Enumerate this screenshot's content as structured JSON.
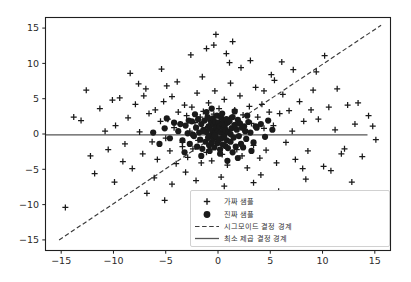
{
  "chart_data": {
    "type": "scatter",
    "title": "",
    "xlabel": "",
    "ylabel": "",
    "xlim": [
      -16.5,
      16.5
    ],
    "ylim": [
      -16.5,
      16.5
    ],
    "grid": false,
    "xticks": [
      -15,
      -10,
      -5,
      0,
      5,
      10,
      15
    ],
    "xticklabels": [
      "−15",
      "−10",
      "−5",
      "0",
      "5",
      "10",
      "15"
    ],
    "yticks": [
      -15,
      -10,
      -5,
      0,
      5,
      10,
      15
    ],
    "yticklabels": [
      "−15",
      "−10",
      "−5",
      "0",
      "5",
      "10",
      "15"
    ],
    "legend_position": "lower right",
    "series": [
      {
        "name": "가짜 샘플",
        "marker": "plus",
        "color": "#1a1a1a",
        "points": [
          [
            -14.6,
            -10.4
          ],
          [
            -12.2,
            -3.1
          ],
          [
            -11.3,
            3.6
          ],
          [
            -10.5,
            -2.2
          ],
          [
            -9.8,
            1.2
          ],
          [
            -9.4,
            5.1
          ],
          [
            -8.9,
            -1.4
          ],
          [
            -8.6,
            2.3
          ],
          [
            -8.2,
            -4.9
          ],
          [
            -7.9,
            4.2
          ],
          [
            -7.5,
            0.3
          ],
          [
            -7.2,
            -2.8
          ],
          [
            -6.9,
            6.4
          ],
          [
            -6.6,
            2.9
          ],
          [
            -6.3,
            -1.1
          ],
          [
            -6.0,
            3.4
          ],
          [
            -5.8,
            -3.6
          ],
          [
            -5.5,
            1.8
          ],
          [
            -5.2,
            4.6
          ],
          [
            -5.0,
            -0.6
          ],
          [
            -4.8,
            2.1
          ],
          [
            -4.6,
            -2.4
          ],
          [
            -4.4,
            5.3
          ],
          [
            -4.2,
            0.9
          ],
          [
            -4.0,
            -4.2
          ],
          [
            -3.8,
            3.1
          ],
          [
            -3.6,
            1.4
          ],
          [
            -3.4,
            -1.8
          ],
          [
            -3.2,
            4.1
          ],
          [
            -3.0,
            2.6
          ],
          [
            -2.9,
            -3.3
          ],
          [
            -2.7,
            0.4
          ],
          [
            -2.5,
            3.8
          ],
          [
            -2.4,
            -2.1
          ],
          [
            -2.2,
            1.6
          ],
          [
            -2.0,
            5.8
          ],
          [
            -1.9,
            -0.9
          ],
          [
            -1.7,
            2.4
          ],
          [
            -1.6,
            -4.1
          ],
          [
            -1.4,
            3.2
          ],
          [
            -1.2,
            0.7
          ],
          [
            -1.1,
            -2.6
          ],
          [
            -0.9,
            4.4
          ],
          [
            -0.8,
            1.1
          ],
          [
            -0.6,
            -3.8
          ],
          [
            -0.4,
            2.8
          ],
          [
            -0.3,
            6.1
          ],
          [
            -0.1,
            -1.3
          ],
          [
            0.1,
            3.6
          ],
          [
            0.2,
            0.2
          ],
          [
            0.4,
            -2.9
          ],
          [
            0.6,
            4.9
          ],
          [
            0.7,
            1.9
          ],
          [
            0.9,
            -4.4
          ],
          [
            1.1,
            2.2
          ],
          [
            1.2,
            7.2
          ],
          [
            1.4,
            -0.4
          ],
          [
            1.6,
            3.4
          ],
          [
            1.8,
            -2.2
          ],
          [
            1.9,
            1.3
          ],
          [
            2.1,
            5.4
          ],
          [
            2.3,
            -3.1
          ],
          [
            2.4,
            2.7
          ],
          [
            2.6,
            0.6
          ],
          [
            2.8,
            -4.8
          ],
          [
            3.0,
            3.9
          ],
          [
            3.2,
            1.5
          ],
          [
            3.4,
            -1.6
          ],
          [
            3.6,
            6.6
          ],
          [
            3.8,
            2.4
          ],
          [
            4.0,
            -3.4
          ],
          [
            4.2,
            4.2
          ],
          [
            4.4,
            0.8
          ],
          [
            4.6,
            -2.3
          ],
          [
            4.9,
            3.1
          ],
          [
            5.1,
            8.4
          ],
          [
            5.3,
            1.2
          ],
          [
            5.6,
            -4.1
          ],
          [
            5.9,
            2.9
          ],
          [
            6.2,
            5.6
          ],
          [
            6.5,
            -1.2
          ],
          [
            6.8,
            3.3
          ],
          [
            7.1,
            0.4
          ],
          [
            7.4,
            -3.6
          ],
          [
            7.8,
            4.6
          ],
          [
            8.2,
            1.8
          ],
          [
            8.6,
            -2.4
          ],
          [
            9.1,
            6.2
          ],
          [
            9.6,
            2.1
          ],
          [
            10.1,
            -4.6
          ],
          [
            10.6,
            3.8
          ],
          [
            11.2,
            0.6
          ],
          [
            11.8,
            -2.8
          ],
          [
            12.4,
            4.1
          ],
          [
            13.1,
            1.4
          ],
          [
            13.8,
            -3.2
          ],
          [
            14.4,
            2.6
          ],
          [
            15.1,
            -0.8
          ],
          [
            -13.1,
            1.9
          ],
          [
            -11.8,
            -5.6
          ],
          [
            -10.1,
            4.8
          ],
          [
            -9.1,
            -3.9
          ],
          [
            -7.6,
            7.1
          ],
          [
            -6.1,
            -6.2
          ],
          [
            -4.9,
            6.8
          ],
          [
            -3.1,
            -5.4
          ],
          [
            -1.5,
            8.1
          ],
          [
            0.3,
            -6.1
          ],
          [
            2.2,
            9.4
          ],
          [
            4.1,
            -5.8
          ],
          [
            6.1,
            10.2
          ],
          [
            8.1,
            -4.9
          ],
          [
            10.2,
            11.1
          ],
          [
            12.1,
            -2.1
          ],
          [
            -2.6,
            11.2
          ],
          [
            -1.1,
            12.1
          ],
          [
            -0.4,
            12.6
          ],
          [
            0.8,
            11.4
          ],
          [
            1.4,
            13.1
          ],
          [
            3.1,
            10.4
          ],
          [
            -8.4,
            8.6
          ],
          [
            9.4,
            8.8
          ],
          [
            11.4,
            6.4
          ],
          [
            13.4,
            4.4
          ],
          [
            -12.6,
            6.2
          ],
          [
            -5.4,
            9.2
          ],
          [
            -3.9,
            7.4
          ],
          [
            5.4,
            7.6
          ],
          [
            7.2,
            9.1
          ],
          [
            -6.8,
            -8.4
          ],
          [
            -4.4,
            -7.1
          ],
          [
            -2.1,
            -6.6
          ],
          [
            0.6,
            -7.4
          ],
          [
            3.4,
            -6.9
          ],
          [
            5.8,
            -8.1
          ],
          [
            8.4,
            -6.4
          ],
          [
            10.8,
            -5.2
          ],
          [
            -9.9,
            -6.8
          ],
          [
            12.8,
            -6.8
          ],
          [
            -13.8,
            2.4
          ],
          [
            14.8,
            1.1
          ],
          [
            -1.2,
            -9.1
          ],
          [
            2.9,
            -9.6
          ],
          [
            -5.1,
            -9.4
          ],
          [
            6.4,
            -9.2
          ],
          [
            -0.2,
            14.1
          ],
          [
            1.1,
            10.1
          ],
          [
            -7.1,
            5.4
          ],
          [
            4.4,
            6.1
          ],
          [
            -3.4,
            -1.2
          ],
          [
            8.9,
            3.4
          ],
          [
            -10.8,
            0.4
          ]
        ]
      },
      {
        "name": "진짜 샘플",
        "marker": "circle",
        "color": "#1a1a1a",
        "points": [
          [
            -3.8,
            0.4
          ],
          [
            -3.4,
            -0.9
          ],
          [
            -3.1,
            1.2
          ],
          [
            -2.9,
            0.1
          ],
          [
            -2.7,
            -1.4
          ],
          [
            -2.5,
            1.8
          ],
          [
            -2.3,
            -0.3
          ],
          [
            -2.1,
            0.9
          ],
          [
            -2.0,
            -1.8
          ],
          [
            -1.9,
            2.1
          ],
          [
            -1.8,
            0.2
          ],
          [
            -1.7,
            -0.8
          ],
          [
            -1.6,
            1.4
          ],
          [
            -1.5,
            -2.1
          ],
          [
            -1.4,
            0.6
          ],
          [
            -1.3,
            1.9
          ],
          [
            -1.2,
            -1.1
          ],
          [
            -1.1,
            0.3
          ],
          [
            -1.0,
            2.4
          ],
          [
            -0.95,
            -0.5
          ],
          [
            -0.9,
            1.1
          ],
          [
            -0.85,
            -1.6
          ],
          [
            -0.8,
            0.8
          ],
          [
            -0.75,
            2.0
          ],
          [
            -0.7,
            -0.2
          ],
          [
            -0.65,
            1.5
          ],
          [
            -0.6,
            -1.2
          ],
          [
            -0.55,
            0.5
          ],
          [
            -0.5,
            2.2
          ],
          [
            -0.45,
            -0.7
          ],
          [
            -0.4,
            1.3
          ],
          [
            -0.35,
            -1.9
          ],
          [
            -0.3,
            0.1
          ],
          [
            -0.25,
            1.7
          ],
          [
            -0.2,
            -0.4
          ],
          [
            -0.15,
            0.9
          ],
          [
            -0.1,
            2.6
          ],
          [
            -0.05,
            -1.3
          ],
          [
            0.0,
            0.4
          ],
          [
            0.05,
            1.6
          ],
          [
            0.1,
            -0.8
          ],
          [
            0.15,
            1.1
          ],
          [
            0.2,
            -2.2
          ],
          [
            0.25,
            0.2
          ],
          [
            0.3,
            2.3
          ],
          [
            0.35,
            -0.6
          ],
          [
            0.4,
            1.4
          ],
          [
            0.45,
            -1.5
          ],
          [
            0.5,
            0.7
          ],
          [
            0.55,
            1.9
          ],
          [
            0.6,
            -0.1
          ],
          [
            0.65,
            1.2
          ],
          [
            0.7,
            -1.7
          ],
          [
            0.75,
            0.5
          ],
          [
            0.8,
            2.1
          ],
          [
            0.85,
            -0.9
          ],
          [
            0.9,
            1.6
          ],
          [
            0.95,
            -2.0
          ],
          [
            1.0,
            0.3
          ],
          [
            1.1,
            1.8
          ],
          [
            1.2,
            -1.1
          ],
          [
            1.3,
            0.8
          ],
          [
            1.4,
            2.4
          ],
          [
            1.5,
            -0.5
          ],
          [
            1.6,
            1.3
          ],
          [
            1.7,
            -1.8
          ],
          [
            1.8,
            0.6
          ],
          [
            1.9,
            2.0
          ],
          [
            2.0,
            -0.3
          ],
          [
            2.1,
            1.5
          ],
          [
            2.2,
            -1.4
          ],
          [
            2.3,
            0.9
          ],
          [
            2.5,
            1.1
          ],
          [
            2.7,
            -0.7
          ],
          [
            2.9,
            1.7
          ],
          [
            3.1,
            0.2
          ],
          [
            3.4,
            -1.2
          ],
          [
            3.7,
            0.9
          ],
          [
            4.1,
            1.4
          ],
          [
            4.5,
            -0.4
          ],
          [
            -4.2,
            1.6
          ],
          [
            -4.6,
            -0.6
          ],
          [
            -5.1,
            0.8
          ],
          [
            -5.6,
            -1.4
          ],
          [
            -2.2,
            2.8
          ],
          [
            -1.1,
            3.1
          ],
          [
            0.4,
            2.9
          ],
          [
            1.6,
            3.2
          ],
          [
            2.8,
            2.6
          ],
          [
            -3.2,
            -2.6
          ],
          [
            -1.6,
            -3.1
          ],
          [
            0.2,
            -2.8
          ],
          [
            1.9,
            -3.4
          ],
          [
            3.2,
            -2.4
          ],
          [
            -0.6,
            3.6
          ],
          [
            0.9,
            -3.8
          ],
          [
            5.2,
            0.6
          ],
          [
            -6.2,
            0.2
          ],
          [
            4.8,
            1.9
          ],
          [
            -4.9,
            2.2
          ],
          [
            -2.4,
            -0.1
          ],
          [
            1.2,
            0.0
          ],
          [
            -0.3,
            -0.2
          ],
          [
            2.6,
            0.4
          ],
          [
            -1.4,
            0.4
          ],
          [
            0.6,
            -0.4
          ],
          [
            3.6,
            1.1
          ],
          [
            -3.6,
            1.4
          ],
          [
            -0.8,
            -2.4
          ],
          [
            2.4,
            -1.9
          ],
          [
            -2.8,
            1.9
          ],
          [
            1.4,
            -2.6
          ]
        ]
      }
    ],
    "lines": [
      {
        "name": "시그모이드 결정 경계",
        "style": "dashed",
        "color": "#3a3a3a",
        "x0": -15.2,
        "y0": -15.0,
        "x1": 15.6,
        "y1": 15.4
      },
      {
        "name": "최소 제곱 결정 경계",
        "style": "solid",
        "color": "#555555",
        "x0": -16.5,
        "y0": -0.12,
        "x1": 14.3,
        "y1": -0.12
      }
    ]
  },
  "legend": {
    "items": [
      {
        "label": "가짜 샘플",
        "marker": "plus"
      },
      {
        "label": "진짜 샘플",
        "marker": "circle"
      },
      {
        "label": "시그모이드 결정 경계",
        "marker": "dashed-line"
      },
      {
        "label": "최소 제곱 결정 경계",
        "marker": "solid-line"
      }
    ]
  },
  "colors": {
    "background": "#ffffff",
    "axes_edge": "#1f1f1f",
    "marker": "#1a1a1a",
    "dashed_line": "#3a3a3a",
    "solid_line": "#555555",
    "legend_border": "#cccccc",
    "tick_text": "#2b2b2b"
  }
}
